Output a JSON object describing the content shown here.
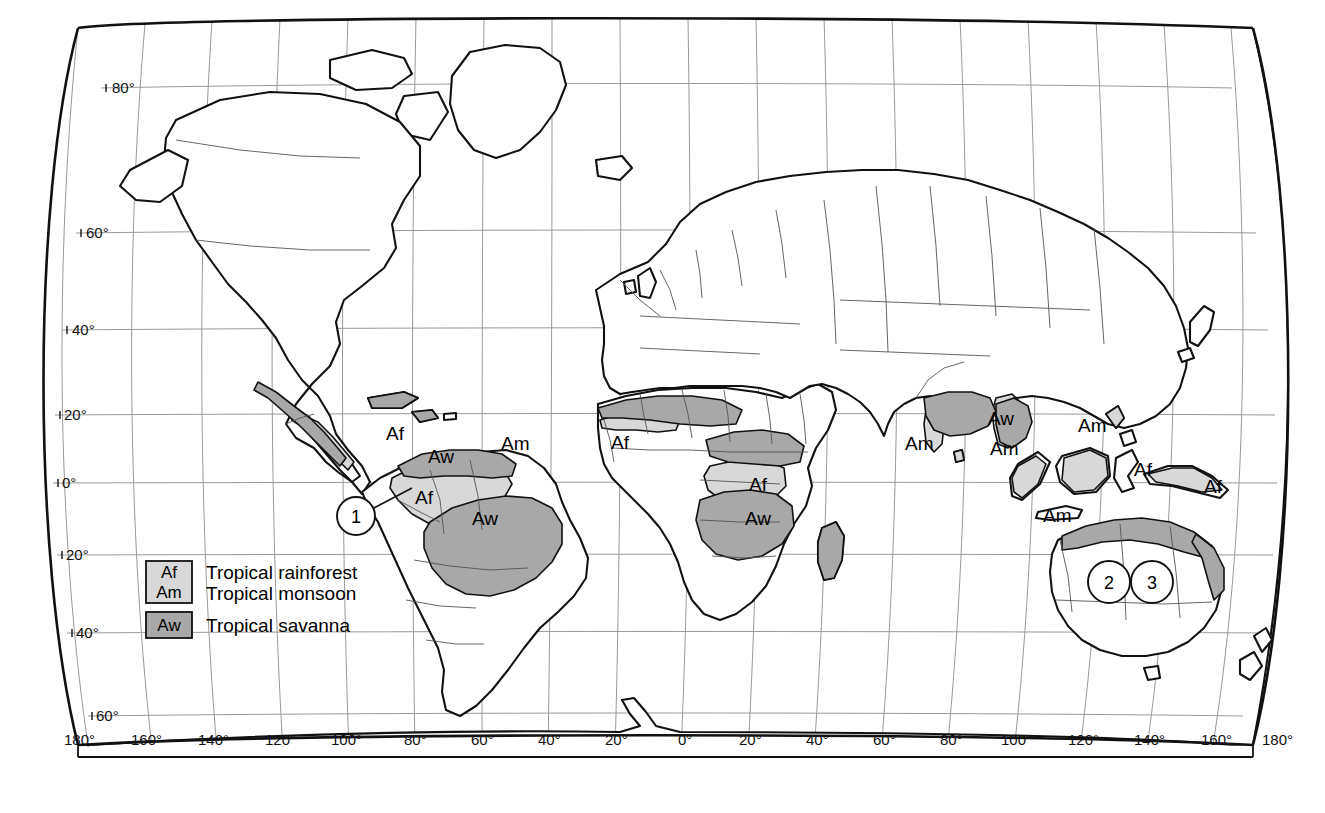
{
  "map": {
    "title": "World map of tropical climate zones",
    "projection": "robinson-like",
    "background_color": "#ffffff",
    "land_outline_color": "#111111",
    "graticule_color": "#888888",
    "frame_color": "#111111",
    "colors": {
      "af_am_fill": "#d8d8d8",
      "aw_fill": "#a8a8a8",
      "land_fill": "#ffffff",
      "border_line": "#555555"
    }
  },
  "legend": {
    "items": [
      {
        "key": "Af",
        "label": "Tropical rainforest",
        "swatch": "#d8d8d8"
      },
      {
        "key": "Am",
        "label": "Tropical monsoon",
        "swatch": "#d8d8d8"
      },
      {
        "key": "Aw",
        "label": "Tropical savanna",
        "swatch": "#a8a8a8"
      }
    ]
  },
  "axes": {
    "longitude_labels": [
      "180°",
      "160°",
      "140°",
      "120°",
      "100°",
      "80°",
      "60°",
      "40°",
      "20°",
      "0°",
      "20°",
      "40°",
      "60°",
      "80°",
      "100°",
      "120°",
      "140°",
      "160°",
      "180°"
    ],
    "latitude_labels": [
      "80°",
      "60°",
      "40°",
      "20°",
      "0°",
      "20°",
      "40°",
      "60°"
    ]
  },
  "climate_labels": [
    {
      "text": "Af",
      "x": 386,
      "y": 440
    },
    {
      "text": "Aw",
      "x": 428,
      "y": 463
    },
    {
      "text": "Am",
      "x": 501,
      "y": 450
    },
    {
      "text": "Af",
      "x": 415,
      "y": 504
    },
    {
      "text": "Aw",
      "x": 472,
      "y": 525
    },
    {
      "text": "Af",
      "x": 611,
      "y": 449
    },
    {
      "text": "Af",
      "x": 749,
      "y": 491
    },
    {
      "text": "Aw",
      "x": 745,
      "y": 525
    },
    {
      "text": "Am",
      "x": 905,
      "y": 450
    },
    {
      "text": "Aw",
      "x": 988,
      "y": 425
    },
    {
      "text": "Am",
      "x": 990,
      "y": 455
    },
    {
      "text": "Am",
      "x": 1078,
      "y": 432
    },
    {
      "text": "Am",
      "x": 1043,
      "y": 522
    },
    {
      "text": "Af",
      "x": 1134,
      "y": 476
    },
    {
      "text": "Af",
      "x": 1204,
      "y": 493
    }
  ],
  "markers": [
    {
      "number": "1",
      "cx": 356,
      "cy": 516,
      "r": 19,
      "leader": {
        "x1": 372,
        "y1": 509,
        "x2": 412,
        "y2": 488
      }
    },
    {
      "number": "2",
      "cx": 1109,
      "cy": 582,
      "r": 21,
      "leader": null
    },
    {
      "number": "3",
      "cx": 1152,
      "cy": 582,
      "r": 21,
      "leader": null
    }
  ]
}
